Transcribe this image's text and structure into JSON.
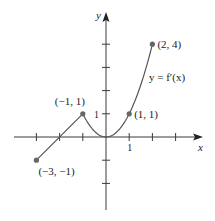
{
  "chart_data": {
    "type": "line",
    "title": "",
    "xlabel": "x",
    "ylabel": "y",
    "xlim": [
      -4,
      4
    ],
    "ylim": [
      -3,
      5
    ],
    "x_ticks": [
      -3,
      -2,
      -1,
      1,
      2,
      3
    ],
    "y_ticks": [
      -2,
      -1,
      1,
      2,
      3,
      4
    ],
    "x_tick_labels": [
      {
        "value": 1,
        "label": "1"
      }
    ],
    "y_tick_labels": [
      {
        "value": 1,
        "label": "1"
      }
    ],
    "grid": false,
    "series": [
      {
        "name": "y = f′(x)",
        "segments": [
          {
            "kind": "linear",
            "from": [
              -3,
              -1
            ],
            "to": [
              -1,
              1
            ]
          },
          {
            "kind": "quadratic",
            "formula": "x^2",
            "from": [
              -1,
              1
            ],
            "to": [
              2,
              4
            ]
          }
        ]
      }
    ],
    "points": [
      {
        "x": -3,
        "y": -1,
        "label": "(−3, −1)"
      },
      {
        "x": -1,
        "y": 1,
        "label": "(−1, 1)"
      },
      {
        "x": 1,
        "y": 1,
        "label": "(1, 1)"
      },
      {
        "x": 2,
        "y": 4,
        "label": "(2, 4)"
      }
    ],
    "annotations": [
      {
        "text": "y = f′(x)",
        "near": [
          1.6,
          2.6
        ]
      }
    ]
  }
}
